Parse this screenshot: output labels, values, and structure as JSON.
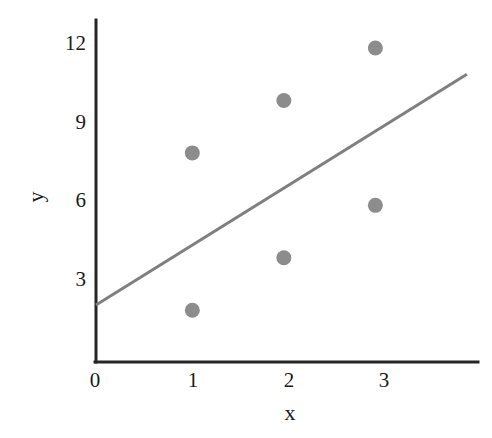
{
  "chart_data": {
    "type": "scatter",
    "title": "",
    "xlabel": "x",
    "ylabel": "y",
    "xlim": [
      0,
      3.85
    ],
    "ylim": [
      0,
      13.0
    ],
    "grid": false,
    "legend": null,
    "x_ticks": [
      "0",
      "1",
      "2",
      "3"
    ],
    "x_tick_values": [
      0,
      1,
      2,
      3
    ],
    "y_ticks": [
      "3",
      "6",
      "9",
      "12"
    ],
    "y_tick_values": [
      3,
      6,
      9,
      12
    ],
    "points": [
      {
        "x": 1.0,
        "y": 8
      },
      {
        "x": 1.0,
        "y": 2
      },
      {
        "x": 1.95,
        "y": 10
      },
      {
        "x": 1.95,
        "y": 4
      },
      {
        "x": 2.9,
        "y": 12
      },
      {
        "x": 2.9,
        "y": 6
      }
    ],
    "series": [
      {
        "name": "data points",
        "marker": "circle",
        "color": "#8c8c8c",
        "x": [
          1.0,
          1.0,
          1.95,
          1.95,
          2.9,
          2.9
        ],
        "values": [
          8,
          2,
          10,
          4,
          12,
          6
        ]
      },
      {
        "name": "trend line",
        "type": "line",
        "color": "#7f7f7f",
        "x_start": 0.0,
        "y_start": 2.2,
        "x_end": 3.85,
        "y_end": 11.0
      }
    ],
    "annotations": []
  },
  "axes": {
    "x_title": "x",
    "y_title": "y"
  },
  "colors": {
    "axis": "#262626",
    "marker": "#8c8c8c",
    "trend_line": "#7f7f7f",
    "text": "#1a1a1a",
    "background": "#ffffff"
  }
}
